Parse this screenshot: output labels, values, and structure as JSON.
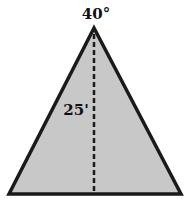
{
  "diagram": {
    "shape": "isosceles-triangle",
    "apex_angle_label": "40°",
    "height_label": "25'",
    "colors": {
      "fill": "#c8c8c8",
      "stroke": "#1a1a1a",
      "text": "#111111"
    }
  }
}
